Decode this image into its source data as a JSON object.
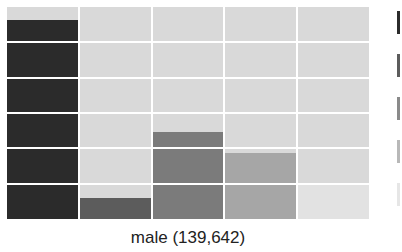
{
  "chart_data": {
    "type": "bar",
    "title": "",
    "xlabel": "male (139,642)",
    "ylabel": "",
    "categories": [
      "c1",
      "c2",
      "c3",
      "c4",
      "c5"
    ],
    "values": [
      94,
      10,
      41,
      31,
      16
    ],
    "ylim": [
      0,
      100
    ],
    "grid": true,
    "legend_position": "right",
    "colors": [
      "#2b2b2b",
      "#5c5c5c",
      "#7b7b7b",
      "#a6a6a6",
      "#e2e2e2"
    ]
  },
  "panel": {
    "label": "male (139,642)",
    "background_color": "#d9d9d9",
    "grid_color": "#ffffff"
  },
  "legend": {
    "swatches": [
      "#2b2b2b",
      "#5c5c5c",
      "#8a8a8a",
      "#b8b8b8",
      "#e6e6e6"
    ]
  }
}
